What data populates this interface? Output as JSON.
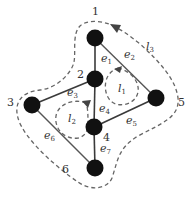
{
  "diagram": {
    "nodes": [
      {
        "id": "1",
        "label": "1",
        "x": 95,
        "y": 38
      },
      {
        "id": "2",
        "label": "2",
        "x": 95,
        "y": 79
      },
      {
        "id": "3",
        "label": "3",
        "x": 32,
        "y": 105
      },
      {
        "id": "4",
        "label": "4",
        "x": 94,
        "y": 127
      },
      {
        "id": "5",
        "label": "5",
        "x": 156,
        "y": 98
      },
      {
        "id": "6",
        "label": "6",
        "x": 95,
        "y": 168
      }
    ],
    "edges": [
      {
        "id": "e1",
        "base": "e",
        "sub": "1",
        "from": "1",
        "to": "2"
      },
      {
        "id": "e2",
        "base": "e",
        "sub": "2",
        "from": "1",
        "to": "5"
      },
      {
        "id": "e3",
        "base": "e",
        "sub": "3",
        "from": "2",
        "to": "3"
      },
      {
        "id": "e4",
        "base": "e",
        "sub": "4",
        "from": "2",
        "to": "4"
      },
      {
        "id": "e5",
        "base": "e",
        "sub": "5",
        "from": "4",
        "to": "5"
      },
      {
        "id": "e6",
        "base": "e",
        "sub": "6",
        "from": "3",
        "to": "6"
      },
      {
        "id": "e7",
        "base": "e",
        "sub": "7",
        "from": "4",
        "to": "6"
      }
    ],
    "loops": [
      {
        "id": "l1",
        "base": "l",
        "sub": "1"
      },
      {
        "id": "l2",
        "base": "l",
        "sub": "2"
      },
      {
        "id": "l3",
        "base": "l",
        "sub": "3"
      }
    ]
  }
}
